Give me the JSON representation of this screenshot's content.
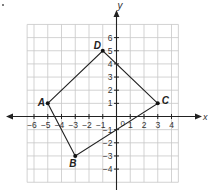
{
  "figure": {
    "type": "coordinate-plane",
    "x_axis_label": "x",
    "y_axis_label": "y",
    "origin_label": "0",
    "x_ticks": [
      "−6",
      "−5",
      "−4",
      "−3",
      "−2",
      "−1",
      "1",
      "2",
      "3",
      "4"
    ],
    "x_tick_values": [
      -6,
      -5,
      -4,
      -3,
      -2,
      -1,
      1,
      2,
      3,
      4
    ],
    "y_ticks": [
      "6",
      "5",
      "4",
      "3",
      "2",
      "1",
      "−1",
      "−2",
      "−3",
      "−4"
    ],
    "y_tick_values": [
      6,
      5,
      4,
      3,
      2,
      1,
      -1,
      -2,
      -3,
      -4
    ],
    "grid_x_range": [
      -6.5,
      4.5
    ],
    "grid_y_range": [
      -5,
      7
    ],
    "points": [
      {
        "label": "A",
        "x": -5,
        "y": 1
      },
      {
        "label": "B",
        "x": -3,
        "y": -3
      },
      {
        "label": "C",
        "x": 3,
        "y": 1
      },
      {
        "label": "D",
        "x": -1,
        "y": 5
      }
    ],
    "polygon_order": [
      "A",
      "D",
      "C",
      "B"
    ],
    "colors": {
      "grid": "#c8c8c8",
      "axis": "#222222",
      "shape": "#222222",
      "point": "#111111"
    }
  }
}
